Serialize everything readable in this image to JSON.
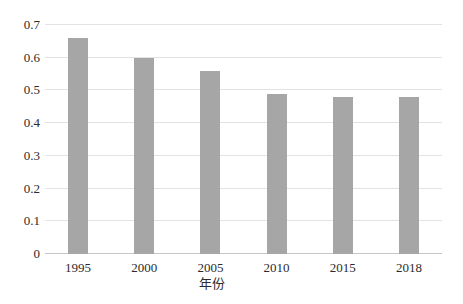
{
  "chart_data": {
    "type": "bar",
    "categories": [
      "1995",
      "2000",
      "2005",
      "2010",
      "2015",
      "2018"
    ],
    "values": [
      0.66,
      0.6,
      0.56,
      0.49,
      0.48,
      0.48
    ],
    "title": "",
    "xlabel": "年份",
    "ylabel": "",
    "ylim": [
      0,
      0.7
    ],
    "yticks": [
      {
        "value": 0.0,
        "label": "0"
      },
      {
        "value": 0.1,
        "label": "0.1"
      },
      {
        "value": 0.2,
        "label": "0.2"
      },
      {
        "value": 0.3,
        "label": "0.3"
      },
      {
        "value": 0.4,
        "label": "0.4"
      },
      {
        "value": 0.5,
        "label": "0.5"
      },
      {
        "value": 0.6,
        "label": "0.6"
      },
      {
        "value": 0.7,
        "label": "0.7"
      }
    ],
    "grid": true,
    "legend": false,
    "colors": {
      "bar": "#a6a6a6",
      "gridline": "#e2e2e2",
      "axis_line": "#c6c6c6",
      "text": "#2b2b2b",
      "background": "#ffffff"
    }
  }
}
